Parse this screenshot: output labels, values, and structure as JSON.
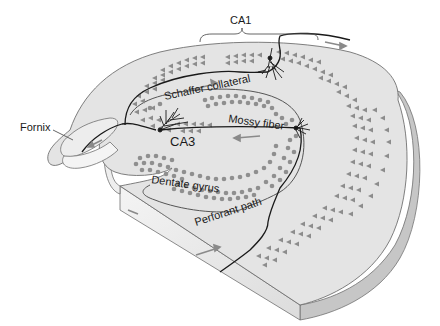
{
  "diagram": {
    "labels": {
      "ca1": "CA1",
      "ca3": "CA3",
      "fornix": "Fornix",
      "schaffer": "Schaffer collateral",
      "mossy": "Mossy fiber",
      "dentate": "Dentate gyrus",
      "perforant": "Perforant path"
    },
    "colors": {
      "surface": "#e6e6e6",
      "surface_light": "#efefef",
      "side_edge": "#c8c8c8",
      "side_front": "#f2f2f2",
      "outline": "#707070",
      "cell_fill": "#8c8c8c",
      "pathway": "#1a1a1a",
      "arrow": "#888888"
    }
  }
}
